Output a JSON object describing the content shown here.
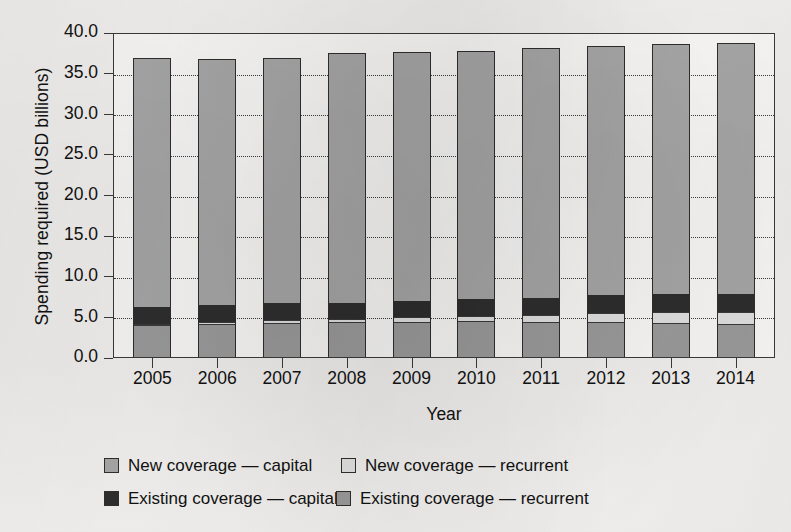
{
  "chart_data": {
    "type": "bar",
    "subtype": "stacked-vertical",
    "title": "",
    "xlabel": "Year",
    "ylabel": "Spending required (USD billions)",
    "categories": [
      "2005",
      "2006",
      "2007",
      "2008",
      "2009",
      "2010",
      "2011",
      "2012",
      "2013",
      "2014"
    ],
    "ylim": [
      0.0,
      40.0
    ],
    "ytick_values": [
      0.0,
      5.0,
      10.0,
      15.0,
      20.0,
      25.0,
      30.0,
      35.0,
      40.0
    ],
    "ytick_labels": [
      "0.0",
      "5.0",
      "10.0",
      "15.0",
      "20.0",
      "25.0",
      "30.0",
      "35.0",
      "40.0"
    ],
    "grid": "horizontal-dotted",
    "legend_position": "below-plot",
    "stack_order_bottom_to_top": [
      "Existing coverage — recurrent",
      "New coverage — recurrent",
      "Existing coverage — capital",
      "New coverage — capital"
    ],
    "series": [
      {
        "name": "Existing coverage — recurrent",
        "color": "#9c9c9c",
        "values": [
          3.8,
          4.0,
          4.1,
          4.2,
          4.2,
          4.3,
          4.2,
          4.2,
          4.1,
          3.9
        ]
      },
      {
        "name": "New coverage — recurrent",
        "color": "#e2e2e2",
        "values": [
          0.2,
          0.3,
          0.4,
          0.5,
          0.7,
          0.8,
          1.0,
          1.2,
          1.4,
          1.6
        ]
      },
      {
        "name": "Existing coverage — capital",
        "color": "#2e2e2e",
        "values": [
          2.1,
          2.1,
          2.1,
          2.0,
          2.0,
          2.0,
          2.1,
          2.2,
          2.2,
          2.3
        ]
      },
      {
        "name": "New coverage — capital",
        "color": "#a8a8a8",
        "values": [
          30.5,
          30.2,
          30.1,
          30.6,
          30.5,
          30.5,
          30.6,
          30.5,
          30.7,
          30.7
        ]
      }
    ],
    "totals": [
      36.6,
      36.6,
      36.7,
      37.3,
      37.4,
      37.6,
      37.9,
      38.1,
      38.4,
      38.5
    ]
  },
  "legend": {
    "items": [
      {
        "label": "New coverage — capital",
        "swatch": "new-capital"
      },
      {
        "label": "New coverage — recurrent",
        "swatch": "new-recurrent"
      },
      {
        "label": "Existing coverage — capital",
        "swatch": "existing-capital"
      },
      {
        "label": "Existing coverage — recurrent",
        "swatch": "existing-recurrent"
      }
    ]
  }
}
